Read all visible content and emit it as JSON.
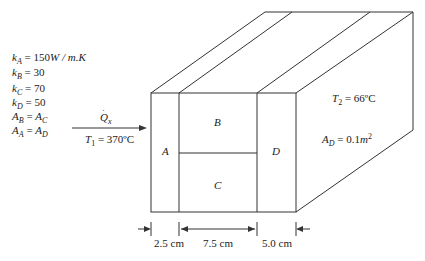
{
  "properties": [
    {
      "sym": "k",
      "sub": "A",
      "rest": " = 150",
      "unit": "W / m.K"
    },
    {
      "sym": "k",
      "sub": "B",
      "rest": " = 30",
      "unit": ""
    },
    {
      "sym": "k",
      "sub": "C",
      "rest": " = 70",
      "unit": ""
    },
    {
      "sym": "k",
      "sub": "D",
      "rest": " = 50",
      "unit": ""
    }
  ],
  "area_relations": [
    {
      "l": "A",
      "lsub": "B",
      "r": "A",
      "rsub": "C"
    },
    {
      "l": "A",
      "lsub": "A",
      "r": "A",
      "rsub": "D"
    }
  ],
  "heat_flow": {
    "sym": "Q",
    "sub": "x"
  },
  "T1": {
    "sym": "T",
    "sub": "1",
    "value": " = 370ºC"
  },
  "T2": {
    "sym": "T",
    "sub": "2",
    "value": " = 66ºC"
  },
  "AD": {
    "sym": "A",
    "sub": "D",
    "value": " = 0.1",
    "unit": "m",
    "exp": "2"
  },
  "layers": {
    "A": "A",
    "B": "B",
    "C": "C",
    "D": "D"
  },
  "dimensions": {
    "d1": "2.5 cm",
    "d2": "7.5 cm",
    "d3": "5.0 cm"
  },
  "colors": {
    "line": "#333333",
    "text": "#222222"
  }
}
